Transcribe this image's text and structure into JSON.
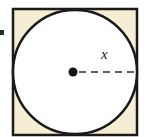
{
  "figure": {
    "type": "geometry-diagram",
    "canvas": {
      "width": 146,
      "height": 137
    },
    "colors": {
      "square_fill": "#F5EDD4",
      "circle_fill": "#FFFFFF",
      "stroke": "#1A1A1A",
      "dash_stroke": "#2B2B2B",
      "page_background": "#FFFFFF"
    },
    "square": {
      "name": "square",
      "x": 13,
      "y": 9,
      "width": 124,
      "height": 126,
      "stroke_width": 2.5
    },
    "circle": {
      "name": "inscribed-circle",
      "cx": 75,
      "cy": 72,
      "r": 62,
      "stroke_width": 2.5
    },
    "center_point": {
      "name": "center-dot",
      "cx": 73,
      "cy": 72,
      "r": 4.5
    },
    "radius_line": {
      "name": "radius-dashed-line",
      "x1": 79,
      "y1": 72,
      "x2": 137,
      "y2": 72,
      "style": "dashed",
      "dash_pattern": "7 5",
      "stroke_width": 1.6
    },
    "radius_label": {
      "text": "x",
      "x": 101,
      "y": 47
    },
    "margin_mark": {
      "name": "margin-bullet",
      "visible": true
    }
  }
}
